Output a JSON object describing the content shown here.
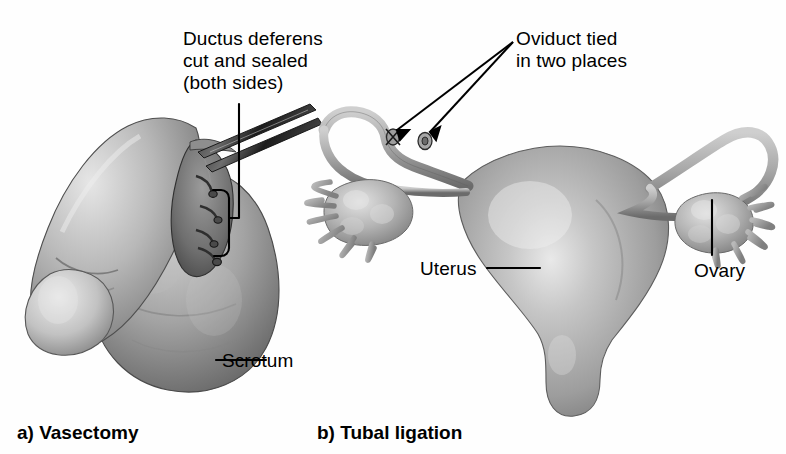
{
  "figure": {
    "background_color": "#fefefe",
    "ink_color": "#000000",
    "tissue_gray_light": "#d8d8d8",
    "tissue_gray_mid": "#9a9a9a",
    "tissue_gray_dark": "#5e5e5e"
  },
  "panels": {
    "a": {
      "caption": "a) Vasectomy",
      "labels": {
        "ductus_deferens": "Ductus deferens\ncut and sealed\n(both sides)",
        "scrotum": "Scrotum"
      },
      "structures": [
        "penis",
        "scrotum",
        "incision-flap",
        "forceps",
        "ductus-deferens-cut-ends"
      ]
    },
    "b": {
      "caption": "b) Tubal ligation",
      "labels": {
        "oviduct_tied": "Oviduct tied\nin two places",
        "uterus": "Uterus",
        "ovary": "Ovary"
      },
      "structures": [
        "uterus",
        "cervix",
        "left-oviduct",
        "right-oviduct",
        "left-ovary",
        "right-ovary",
        "fimbriae",
        "ligature-knots"
      ]
    }
  },
  "annotations": {
    "ligature_count": 2,
    "arrow_targets": [
      "left-oviduct-proximal-tie",
      "left-oviduct-distal-tie"
    ],
    "bracket_targets": [
      "vas-deferens-upper-cut-end",
      "vas-deferens-lower-cut-end"
    ]
  }
}
